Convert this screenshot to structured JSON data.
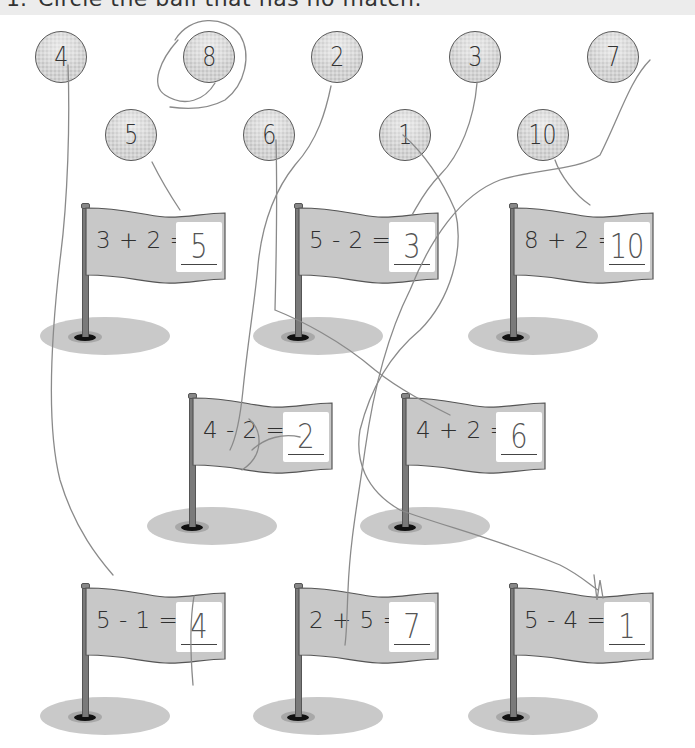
{
  "header": {
    "number": "1.",
    "instruction": "Circle the ball that has no match."
  },
  "balls": [
    {
      "value": "4",
      "x": 35,
      "y": 31,
      "circled": false
    },
    {
      "value": "8",
      "x": 183,
      "y": 31,
      "circled": true
    },
    {
      "value": "2",
      "x": 311,
      "y": 31,
      "circled": false
    },
    {
      "value": "3",
      "x": 449,
      "y": 31,
      "circled": false
    },
    {
      "value": "7",
      "x": 587,
      "y": 31,
      "circled": false
    },
    {
      "value": "5",
      "x": 105,
      "y": 109,
      "circled": false
    },
    {
      "value": "6",
      "x": 243,
      "y": 109,
      "circled": false
    },
    {
      "value": "1",
      "x": 379,
      "y": 109,
      "circled": false
    },
    {
      "value": "10",
      "x": 517,
      "y": 109,
      "circled": false
    }
  ],
  "flags": [
    {
      "equation": "3 + 2 =",
      "answer": "5",
      "x": 40,
      "y": 205
    },
    {
      "equation": "5 - 2 =",
      "answer": "3",
      "x": 253,
      "y": 205
    },
    {
      "equation": "8 + 2 =",
      "answer": "10",
      "x": 468,
      "y": 205
    },
    {
      "equation": "4 - 2 =",
      "answer": "2",
      "x": 147,
      "y": 395
    },
    {
      "equation": "4 + 2 =",
      "answer": "6",
      "x": 360,
      "y": 395
    },
    {
      "equation": "5 - 1 =",
      "answer": "4",
      "x": 40,
      "y": 585
    },
    {
      "equation": "2 + 5 =",
      "answer": "7",
      "x": 253,
      "y": 585
    },
    {
      "equation": "5 - 4 =",
      "answer": "1",
      "x": 468,
      "y": 585
    }
  ],
  "colors": {
    "flag_fill": "#c8c8c8",
    "flag_stroke": "#555555",
    "pencil": "#8a8a8a",
    "header_band": "#ececec"
  }
}
